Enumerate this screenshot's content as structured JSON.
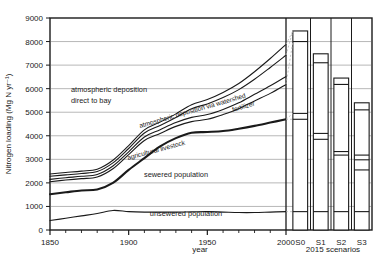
{
  "chart_data": {
    "type": "area",
    "title": "",
    "xlabel": "year",
    "ylabel": "Nitrogen loading (Mg N yr⁻¹)",
    "ylim": [
      0,
      9000
    ],
    "xlim": [
      1850,
      2000
    ],
    "grid": true,
    "legend_position": "inline-annotations",
    "y_ticks": [
      "0",
      "1000",
      "2000",
      "3000",
      "4000",
      "5000",
      "6000",
      "7000",
      "8000",
      "9000"
    ],
    "x_ticks": [
      "1850",
      "1900",
      "1950",
      "2000"
    ],
    "x_minor_step": 10,
    "scenario_axis_label": "2015 scenarios",
    "scenario_categories": [
      "S0",
      "S1",
      "S2",
      "S3"
    ],
    "annotations": [
      "atmospheric deposition direct to bay",
      "atmospheric deposition via watershed",
      "fertilizer",
      "agricultural livestock",
      "sewered population",
      "unsewered population"
    ],
    "annotation_lines": {
      "atm_direct_l1": "atmospheric deposition",
      "atm_direct_l2": "direct to bay",
      "atm_watershed": "atmospheric deposition via watershed",
      "fertilizer": "fertilizer",
      "livestock": "agricultural livestock",
      "sewered": "sewered population",
      "unsewered": "unsewered population"
    },
    "x": [
      1850,
      1860,
      1870,
      1880,
      1890,
      1900,
      1910,
      1920,
      1930,
      1940,
      1950,
      1960,
      1970,
      1980,
      1990,
      2000
    ],
    "series": [
      {
        "name": "unsewered population",
        "cumulative": [
          400,
          500,
          600,
          700,
          830,
          780,
          760,
          760,
          760,
          770,
          780,
          760,
          740,
          740,
          760,
          780
        ]
      },
      {
        "name": "sewered population",
        "cumulative": [
          1520,
          1600,
          1680,
          1720,
          2000,
          2550,
          3050,
          3550,
          3900,
          4130,
          4160,
          4200,
          4300,
          4420,
          4560,
          4700
        ]
      },
      {
        "name": "agricultural livestock",
        "cumulative": [
          2050,
          2120,
          2180,
          2250,
          2600,
          3200,
          3800,
          4100,
          4400,
          4600,
          4700,
          4900,
          5150,
          5480,
          5800,
          6180
        ]
      },
      {
        "name": "fertilizer",
        "cumulative": [
          2150,
          2220,
          2280,
          2360,
          2720,
          3320,
          3950,
          4260,
          4560,
          4780,
          4900,
          5120,
          5400,
          5760,
          6120,
          6520
        ]
      },
      {
        "name": "atmospheric deposition via watershed",
        "cumulative": [
          2280,
          2340,
          2400,
          2480,
          2850,
          3460,
          4120,
          4440,
          4780,
          5150,
          5350,
          5620,
          5960,
          6400,
          6900,
          7420
        ]
      },
      {
        "name": "atmospheric deposition direct to bay",
        "cumulative": [
          2380,
          2440,
          2500,
          2580,
          2960,
          3580,
          4250,
          4580,
          4930,
          5320,
          5540,
          5840,
          6220,
          6720,
          7280,
          7880
        ]
      }
    ],
    "scenario_bars": [
      {
        "label": "S0",
        "total": 8450,
        "dividers": [
          780,
          4700,
          4950,
          8000,
          8450
        ]
      },
      {
        "label": "S1",
        "total": 7480,
        "dividers": [
          780,
          3850,
          4100,
          7100,
          7480
        ]
      },
      {
        "label": "S2",
        "total": 6450,
        "dividers": [
          780,
          3180,
          3330,
          6180,
          6450
        ]
      },
      {
        "label": "S3",
        "total": 5400,
        "dividers": [
          780,
          2550,
          2980,
          3180,
          5100,
          5400
        ]
      }
    ]
  },
  "colors": {
    "axis": "#1a1a1a",
    "grid": "#9a9a9a",
    "line": "#1a1a1a",
    "leader": "#b5b5b5",
    "background": "#ffffff"
  }
}
